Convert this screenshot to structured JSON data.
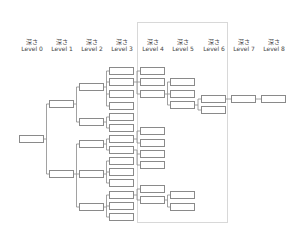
{
  "headers": [
    {
      "jp": "深さ",
      "label": "Level 0"
    },
    {
      "jp": "深さ",
      "label": "Level 1"
    },
    {
      "jp": "深さ",
      "label": "Level 2"
    },
    {
      "jp": "深さ",
      "label": "Level 3"
    },
    {
      "jp": "深さ",
      "label": "Level 4"
    },
    {
      "jp": "深さ",
      "label": "Level 5"
    },
    {
      "jp": "深さ",
      "label": "Level 6"
    },
    {
      "jp": "深さ",
      "label": "Level 7"
    },
    {
      "jp": "深さ",
      "label": "Level 8"
    }
  ],
  "colors": {
    "node_border": "#8a8a8a",
    "connector": "#8a8a8a",
    "region_border": "#d8d8d8",
    "header_text": "#444444"
  },
  "tree": {
    "column_x": [
      19,
      49,
      79,
      109,
      140,
      170,
      201,
      231,
      261
    ],
    "node_size": [
      25,
      8
    ],
    "nodes": [
      {
        "id": "a",
        "level": 0,
        "y": 135,
        "parent": null
      },
      {
        "id": "b1",
        "level": 1,
        "y": 100,
        "parent": "a"
      },
      {
        "id": "b2",
        "level": 1,
        "y": 170,
        "parent": "a"
      },
      {
        "id": "c1",
        "level": 2,
        "y": 83,
        "parent": "b1"
      },
      {
        "id": "c2",
        "level": 2,
        "y": 118,
        "parent": "b1"
      },
      {
        "id": "c3",
        "level": 2,
        "y": 140,
        "parent": "b2"
      },
      {
        "id": "c4",
        "level": 2,
        "y": 170,
        "parent": "b2"
      },
      {
        "id": "c5",
        "level": 2,
        "y": 203,
        "parent": "b2"
      },
      {
        "id": "d1",
        "level": 3,
        "y": 67,
        "parent": "c1"
      },
      {
        "id": "d2",
        "level": 3,
        "y": 78,
        "parent": "c1"
      },
      {
        "id": "d3",
        "level": 3,
        "y": 90,
        "parent": "c1"
      },
      {
        "id": "d4",
        "level": 3,
        "y": 102,
        "parent": "c1"
      },
      {
        "id": "d5",
        "level": 3,
        "y": 113,
        "parent": "c2"
      },
      {
        "id": "d6",
        "level": 3,
        "y": 124,
        "parent": "c2"
      },
      {
        "id": "d7",
        "level": 3,
        "y": 135,
        "parent": "c3"
      },
      {
        "id": "d8",
        "level": 3,
        "y": 146,
        "parent": "c3"
      },
      {
        "id": "d9",
        "level": 3,
        "y": 157,
        "parent": "c4"
      },
      {
        "id": "d10",
        "level": 3,
        "y": 168,
        "parent": "c4"
      },
      {
        "id": "d11",
        "level": 3,
        "y": 179,
        "parent": "c4"
      },
      {
        "id": "d12",
        "level": 3,
        "y": 191,
        "parent": "c5"
      },
      {
        "id": "d13",
        "level": 3,
        "y": 202,
        "parent": "c5"
      },
      {
        "id": "d14",
        "level": 3,
        "y": 213,
        "parent": "c5"
      },
      {
        "id": "e1",
        "level": 4,
        "y": 67,
        "parent": "d2"
      },
      {
        "id": "e2",
        "level": 4,
        "y": 78,
        "parent": "d2"
      },
      {
        "id": "e3",
        "level": 4,
        "y": 90,
        "parent": "d2"
      },
      {
        "id": "e4",
        "level": 4,
        "y": 127,
        "parent": "d7"
      },
      {
        "id": "e5",
        "level": 4,
        "y": 139,
        "parent": "d7"
      },
      {
        "id": "e6",
        "level": 4,
        "y": 150,
        "parent": "d8"
      },
      {
        "id": "e7",
        "level": 4,
        "y": 161,
        "parent": "d8"
      },
      {
        "id": "e8",
        "level": 4,
        "y": 185,
        "parent": "d12"
      },
      {
        "id": "e9",
        "level": 4,
        "y": 196,
        "parent": "d12"
      },
      {
        "id": "f1",
        "level": 5,
        "y": 78,
        "parent": "e3"
      },
      {
        "id": "f2",
        "level": 5,
        "y": 90,
        "parent": "e3"
      },
      {
        "id": "f3",
        "level": 5,
        "y": 101,
        "parent": "e3"
      },
      {
        "id": "f4",
        "level": 5,
        "y": 191,
        "parent": "e9"
      },
      {
        "id": "f5",
        "level": 5,
        "y": 203,
        "parent": "e9"
      },
      {
        "id": "g1",
        "level": 6,
        "y": 95,
        "parent": "f3"
      },
      {
        "id": "g2",
        "level": 6,
        "y": 106,
        "parent": "f3"
      },
      {
        "id": "h1",
        "level": 7,
        "y": 95,
        "parent": "g1"
      },
      {
        "id": "i1",
        "level": 8,
        "y": 95,
        "parent": "h1"
      }
    ]
  },
  "region": {
    "x": 137,
    "y": 22,
    "width": 91,
    "height": 201
  }
}
